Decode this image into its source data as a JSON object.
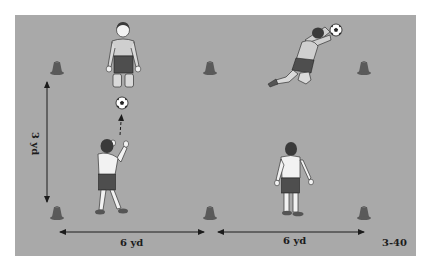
{
  "diagram": {
    "figure_number": "3-40",
    "field_color": "#a9a9a9",
    "cone_color": "#5a5a5a",
    "measurements": {
      "vertical_label": "3 yd",
      "horizontal_left_label": "6 yd",
      "horizontal_right_label": "6 yd"
    },
    "cones": [
      {
        "id": "top-left",
        "x": 57,
        "y": 68
      },
      {
        "id": "top-middle",
        "x": 210,
        "y": 68
      },
      {
        "id": "top-right",
        "x": 364,
        "y": 68
      },
      {
        "id": "bottom-left",
        "x": 57,
        "y": 212
      },
      {
        "id": "bottom-middle",
        "x": 210,
        "y": 212
      },
      {
        "id": "bottom-right",
        "x": 364,
        "y": 212
      }
    ],
    "players": [
      {
        "id": "kneeling-keeper",
        "role": "goalkeeper kneeling ready",
        "x": 123,
        "y": 55
      },
      {
        "id": "diving-keeper",
        "role": "goalkeeper diving catch",
        "x": 305,
        "y": 55
      },
      {
        "id": "thrower",
        "role": "server tossing ball",
        "x": 110,
        "y": 180
      },
      {
        "id": "receiver",
        "role": "server waiting",
        "x": 290,
        "y": 180
      }
    ],
    "balls": [
      {
        "id": "tossed-ball",
        "x": 122,
        "y": 103
      },
      {
        "id": "caught-ball",
        "x": 336,
        "y": 30
      }
    ]
  }
}
